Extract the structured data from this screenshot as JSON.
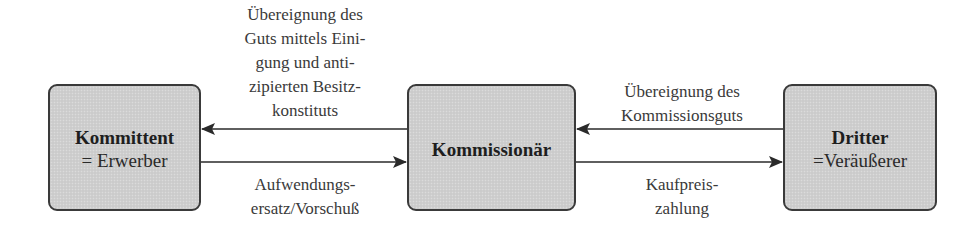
{
  "diagram": {
    "nodes": [
      {
        "id": "kommittent",
        "title": "Kommittent",
        "subtitle": "= Erwerber"
      },
      {
        "id": "kommissionaer",
        "title": "Kommissionär",
        "subtitle": ""
      },
      {
        "id": "dritter",
        "title": "Dritter",
        "subtitle": "=Veräußerer"
      }
    ],
    "edges": [
      {
        "from": "kommissionaer",
        "to": "kommittent",
        "label_lines": [
          "Übereignung des",
          "Guts mittels Eini-",
          "gung und anti-",
          "zipierten Besitz-",
          "konstituts"
        ]
      },
      {
        "from": "kommittent",
        "to": "kommissionaer",
        "label_lines": [
          "Aufwendungs-",
          "ersatz/Vorschuß"
        ]
      },
      {
        "from": "dritter",
        "to": "kommissionaer",
        "label_lines": [
          "Übereignung des",
          "Kommissionsguts"
        ]
      },
      {
        "from": "kommissionaer",
        "to": "dritter",
        "label_lines": [
          "Kaufpreis-",
          "zahlung"
        ]
      }
    ],
    "colors": {
      "box_fill": "#cfcfcf",
      "box_border": "#3a3a3a",
      "arrow": "#2a2a2a",
      "text": "#2a2a2a"
    }
  }
}
